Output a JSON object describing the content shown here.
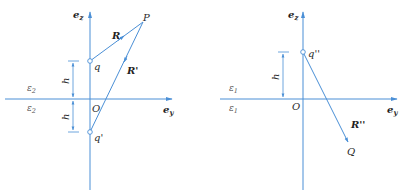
{
  "colors": {
    "line": "#4a8fd6",
    "text": "#2a2a2a",
    "background": "#ffffff"
  },
  "left_panel": {
    "axis_z_label": "e",
    "axis_z_sub": "z",
    "axis_y_label": "e",
    "axis_y_sub": "y",
    "origin_label": "O",
    "charge_label": "q",
    "image_charge_label": "q'",
    "point_label": "P",
    "vector_R_label": "R",
    "vector_Rprime_label": "R'",
    "h_upper_label": "h",
    "h_lower_label": "h",
    "medium_upper_label": "ε",
    "medium_upper_sub": "2",
    "medium_lower_label": "ε",
    "medium_lower_sub": "2"
  },
  "right_panel": {
    "axis_z_label": "e",
    "axis_z_sub": "z",
    "axis_y_label": "e",
    "axis_y_sub": "y",
    "origin_label": "O",
    "image_charge_label": "q''",
    "point_label": "Q",
    "vector_label": "R''",
    "h_label": "h",
    "medium_upper_label": "ε",
    "medium_upper_sub": "1",
    "medium_lower_label": "ε",
    "medium_lower_sub": "1"
  }
}
